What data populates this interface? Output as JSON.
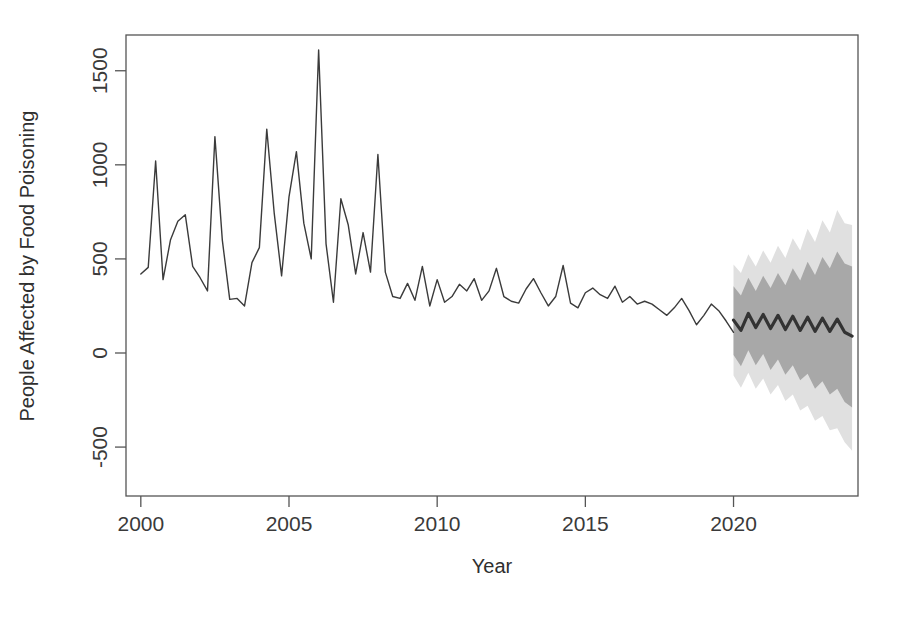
{
  "figure": {
    "header_text": "",
    "caption_text": ""
  },
  "chart_data": {
    "type": "line",
    "title": "",
    "subtitle": "",
    "xlabel": "Year",
    "ylabel": "People Affected by Food Poisoning",
    "grid": false,
    "legend": "none",
    "xlim": [
      1999.5,
      2024.2
    ],
    "ylim": [
      -760,
      1690
    ],
    "xticks": [
      2000,
      2005,
      2010,
      2015,
      2020
    ],
    "xtick_labels": [
      "2000",
      "2005",
      "2010",
      "2015",
      "2020"
    ],
    "yticks": [
      -500,
      0,
      500,
      1000,
      1500
    ],
    "ytick_labels": [
      "-500",
      "0",
      "500",
      "1000",
      "1500"
    ],
    "box": true,
    "series": [
      {
        "name": "Observed",
        "color": "#3b3b3b",
        "width": 1.4,
        "x": [
          2000.0,
          2000.25,
          2000.5,
          2000.75,
          2001.0,
          2001.25,
          2001.5,
          2001.75,
          2002.0,
          2002.25,
          2002.5,
          2002.75,
          2003.0,
          2003.25,
          2003.5,
          2003.75,
          2004.0,
          2004.25,
          2004.5,
          2004.75,
          2005.0,
          2005.25,
          2005.5,
          2005.75,
          2006.0,
          2006.25,
          2006.5,
          2006.75,
          2007.0,
          2007.25,
          2007.5,
          2007.75,
          2008.0,
          2008.25,
          2008.5,
          2008.75,
          2009.0,
          2009.25,
          2009.5,
          2009.75,
          2010.0,
          2010.25,
          2010.5,
          2010.75,
          2011.0,
          2011.25,
          2011.5,
          2011.75,
          2012.0,
          2012.25,
          2012.5,
          2012.75,
          2013.0,
          2013.25,
          2013.5,
          2013.75,
          2014.0,
          2014.25,
          2014.5,
          2014.75,
          2015.0,
          2015.25,
          2015.5,
          2015.75,
          2016.0,
          2016.25,
          2016.5,
          2016.75,
          2017.0,
          2017.25,
          2017.5,
          2017.75,
          2018.0,
          2018.25,
          2018.5,
          2018.75,
          2019.0,
          2019.25,
          2019.5,
          2019.75,
          2020.0
        ],
        "values": [
          420,
          455,
          1020,
          390,
          600,
          700,
          735,
          460,
          400,
          330,
          1150,
          600,
          285,
          290,
          250,
          480,
          560,
          1190,
          745,
          410,
          830,
          1070,
          690,
          500,
          1610,
          580,
          270,
          820,
          680,
          420,
          640,
          430,
          1055,
          430,
          300,
          290,
          370,
          280,
          460,
          250,
          390,
          270,
          300,
          365,
          330,
          395,
          280,
          330,
          450,
          300,
          275,
          265,
          340,
          395,
          320,
          250,
          300,
          465,
          265,
          240,
          320,
          345,
          310,
          290,
          355,
          270,
          300,
          260,
          275,
          260,
          230,
          200,
          240,
          290,
          225,
          150,
          200,
          260,
          225,
          170,
          110
        ]
      },
      {
        "name": "Point Forecast",
        "color": "#333333",
        "width": 3.2,
        "x": [
          2020.0,
          2020.25,
          2020.5,
          2020.75,
          2021.0,
          2021.25,
          2021.5,
          2021.75,
          2022.0,
          2022.25,
          2022.5,
          2022.75,
          2023.0,
          2023.25,
          2023.5,
          2023.75,
          2024.0
        ],
        "values": [
          175,
          120,
          210,
          135,
          205,
          130,
          200,
          125,
          195,
          120,
          190,
          115,
          185,
          115,
          180,
          110,
          90
        ]
      }
    ],
    "intervals": [
      {
        "name": "95% Prediction Interval",
        "level": 95,
        "color": "#e0e0e0",
        "x": [
          2020.0,
          2020.25,
          2020.5,
          2020.75,
          2021.0,
          2021.25,
          2021.5,
          2021.75,
          2022.0,
          2022.25,
          2022.5,
          2022.75,
          2023.0,
          2023.25,
          2023.5,
          2023.75,
          2024.0
        ],
        "upper": [
          470,
          425,
          525,
          460,
          545,
          480,
          570,
          505,
          610,
          545,
          660,
          590,
          705,
          640,
          760,
          690,
          680
        ],
        "lower": [
          -120,
          -185,
          -105,
          -190,
          -135,
          -220,
          -170,
          -255,
          -220,
          -305,
          -280,
          -360,
          -335,
          -410,
          -400,
          -475,
          -520
        ]
      },
      {
        "name": "80% Prediction Interval",
        "level": 80,
        "color": "#a8a8a8",
        "x": [
          2020.0,
          2020.25,
          2020.5,
          2020.75,
          2021.0,
          2021.25,
          2021.5,
          2021.75,
          2022.0,
          2022.25,
          2022.5,
          2022.75,
          2023.0,
          2023.25,
          2023.5,
          2023.75,
          2024.0
        ],
        "upper": [
          355,
          305,
          400,
          330,
          410,
          345,
          425,
          360,
          450,
          385,
          485,
          415,
          510,
          450,
          540,
          475,
          460
        ],
        "lower": [
          -10,
          -70,
          15,
          -65,
          -5,
          -90,
          -35,
          -115,
          -65,
          -145,
          -110,
          -190,
          -150,
          -220,
          -190,
          -260,
          -290
        ]
      }
    ]
  }
}
